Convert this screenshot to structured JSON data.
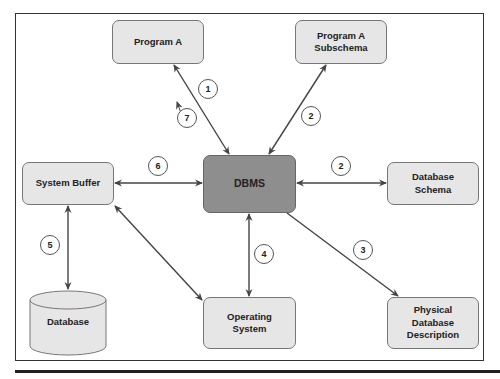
{
  "diagram": {
    "nodes": {
      "program_a": "Program A",
      "program_a_subschema_l1": "Program A",
      "program_a_subschema_l2": "Subschema",
      "system_buffer": "System Buffer",
      "dbms": "DBMS",
      "database_schema_l1": "Database",
      "database_schema_l2": "Schema",
      "database": "Database",
      "operating_system_l1": "Operating",
      "operating_system_l2": "System",
      "physical_db_l1": "Physical",
      "physical_db_l2": "Database",
      "physical_db_l3": "Description"
    },
    "steps": {
      "s1": "1",
      "s2a": "2",
      "s2b": "2",
      "s3": "3",
      "s4": "4",
      "s5": "5",
      "s6": "6",
      "s7": "7"
    },
    "edges": [
      {
        "from": "Program A",
        "to": "DBMS",
        "step": "1",
        "direction": "both"
      },
      {
        "from": "Program A Subschema",
        "to": "DBMS",
        "step": "2",
        "direction": "both"
      },
      {
        "from": "Database Schema",
        "to": "DBMS",
        "step": "2",
        "direction": "both"
      },
      {
        "from": "DBMS",
        "to": "Physical Database Description",
        "step": "3",
        "direction": "forward"
      },
      {
        "from": "DBMS",
        "to": "Operating System",
        "step": "4",
        "direction": "both"
      },
      {
        "from": "System Buffer",
        "to": "Database",
        "step": "5",
        "direction": "both"
      },
      {
        "from": "System Buffer",
        "to": "DBMS",
        "step": "6",
        "direction": "both"
      },
      {
        "from": "System Buffer",
        "to": "Operating System",
        "step": "",
        "direction": "both"
      },
      {
        "from": "",
        "to": "Program A",
        "step": "7",
        "direction": "forward"
      }
    ],
    "colors": {
      "node_fill": "#e6e6e6",
      "dbms_fill": "#8e8e8e",
      "line": "#444444"
    }
  }
}
